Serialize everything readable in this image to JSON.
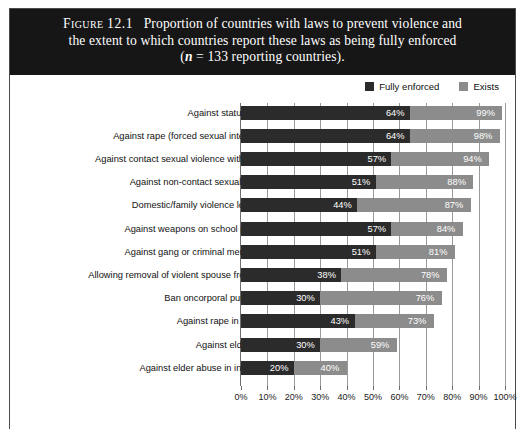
{
  "figure": {
    "label": "Figure",
    "number": "12.1",
    "caption_line1": "Proportion of countries with laws to prevent violence and",
    "caption_line2": "the extent to which countries report these laws as being fully enforced",
    "caption_line3_pre": "(",
    "caption_line3_n": "n",
    "caption_line3_post": " = 133 reporting countries)."
  },
  "colors": {
    "caption_background": "#161616",
    "caption_text": "#ffffff",
    "fully_enforced": "#2b2b2b",
    "exists": "#8c8c8c",
    "frame": "#4a4a4a",
    "gridline": "#9a9a9a"
  },
  "legend": {
    "position": "top-right",
    "entries": [
      {
        "label": "Fully enforced",
        "color": "#2b2b2b"
      },
      {
        "label": "Exists",
        "color": "#8c8c8c"
      }
    ]
  },
  "chart_data": {
    "type": "bar",
    "orientation": "horizontal",
    "title": "Proportion of countries with laws to prevent violence and the extent to which countries report these laws as being fully enforced (n = 133 reporting countries).",
    "xlabel": "",
    "ylabel": "",
    "xlim": [
      0,
      100
    ],
    "grid": true,
    "legend_position": "top-right",
    "xticks": [
      0,
      10,
      20,
      30,
      40,
      50,
      60,
      70,
      80,
      90,
      100
    ],
    "xticklabels": [
      "0%",
      "10%",
      "20%",
      "30%",
      "40%",
      "50%",
      "60%",
      "70%",
      "80%",
      "90%",
      "100%"
    ],
    "categories": [
      "Against statutory rape",
      "Against rape (forced sexual intercourse)",
      "Against contact sexual violence without rape",
      "Against non-contact sexual violence",
      "Domestic/family violence legislation",
      "Against weapons on school premises",
      "Against gang or criminal membership",
      "Allowing removal of violent spouse from home",
      "Ban oncorporal punishment",
      "Against rape in marriage",
      "Against elder abuse",
      "Against elder abuse in institutions"
    ],
    "series": [
      {
        "name": "Fully enforced",
        "color": "#2b2b2b",
        "values": [
          64,
          64,
          57,
          51,
          44,
          57,
          51,
          38,
          30,
          43,
          30,
          20
        ],
        "labels": [
          "64%",
          "64%",
          "57%",
          "51%",
          "44%",
          "57%",
          "51%",
          "38%",
          "30%",
          "43%",
          "30%",
          "20%"
        ]
      },
      {
        "name": "Exists",
        "color": "#8c8c8c",
        "values": [
          99,
          98,
          94,
          88,
          87,
          84,
          81,
          78,
          76,
          73,
          59,
          40
        ],
        "labels": [
          "99%",
          "98%",
          "94%",
          "88%",
          "87%",
          "84%",
          "81%",
          "78%",
          "76%",
          "73%",
          "59%",
          "40%"
        ]
      }
    ]
  }
}
